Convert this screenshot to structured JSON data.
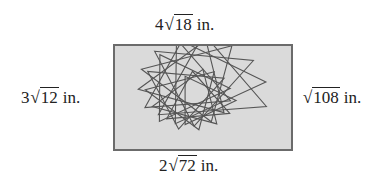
{
  "diagram": {
    "type": "rectangle-with-side-labels",
    "colors": {
      "fill": "#dadada",
      "border": "#6b6b6b",
      "pattern_stroke": "#555555",
      "text": "#222222"
    },
    "sides": {
      "top": {
        "coefficient": "4",
        "radicand": "18",
        "unit": "in."
      },
      "left": {
        "coefficient": "3",
        "radicand": "12",
        "unit": "in."
      },
      "right": {
        "coefficient": "",
        "radicand": "108",
        "unit": "in."
      },
      "bottom": {
        "coefficient": "2",
        "radicand": "72",
        "unit": "in."
      }
    },
    "radical_symbol": "√",
    "pattern": {
      "description": "spiral of rotated overlapping triangles",
      "count": 12
    }
  }
}
